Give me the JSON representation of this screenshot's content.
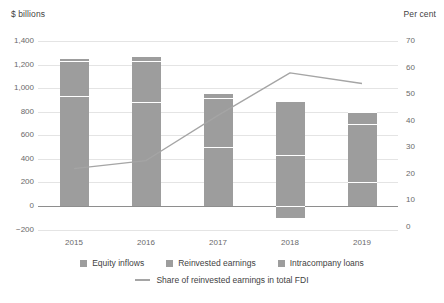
{
  "chart_data": {
    "type": "bar",
    "title": "",
    "subtitle": "",
    "left_axis_title": "$ billions",
    "right_axis_title": "Per cent",
    "xlabel": "",
    "ylabel": "$ billions",
    "categories": [
      "2015",
      "2016",
      "2017",
      "2018",
      "2019"
    ],
    "ylim": [
      -200,
      1400
    ],
    "y2lim": [
      0,
      70
    ],
    "yticks": [
      "-200",
      "0",
      "200",
      "400",
      "600",
      "800",
      "1,000",
      "1,200",
      "1,400"
    ],
    "ytick_values": [
      -200,
      0,
      200,
      400,
      600,
      800,
      1000,
      1200,
      1400
    ],
    "y2ticks": [
      "0",
      "10",
      "20",
      "30",
      "40",
      "50",
      "60",
      "70"
    ],
    "y2tick_values": [
      0,
      10,
      20,
      30,
      40,
      50,
      60,
      70
    ],
    "grid": true,
    "stacked": true,
    "legend_position": "bottom",
    "series": [
      {
        "name": "Equity inflows",
        "type": "bar",
        "axis": "left",
        "values": [
          930,
          880,
          500,
          430,
          205
        ]
      },
      {
        "name": "Reinvested earnings",
        "type": "bar",
        "axis": "left",
        "values": [
          300,
          350,
          420,
          460,
          490
        ]
      },
      {
        "name": "Intracompany loans",
        "type": "bar",
        "axis": "left",
        "values": [
          25,
          40,
          40,
          -100,
          105
        ]
      },
      {
        "name": "Share of reinvested earnings in total FDI",
        "type": "line",
        "axis": "right",
        "values": [
          22,
          25,
          42,
          58,
          54
        ]
      }
    ],
    "totals": [
      1255,
      1270,
      960,
      890,
      800
    ],
    "colors": {
      "bar": "#9d9d9d",
      "line": "#a5a5a5",
      "grid": "#e4e4e4",
      "zero_axis": "#8e8e8e",
      "text": "#3f3f3f",
      "tick_text": "#6a6a6a"
    }
  },
  "legend": {
    "bar_items": [
      {
        "label": "Equity inflows"
      },
      {
        "label": "Reinvested earnings"
      },
      {
        "label": "Intracompany loans"
      }
    ],
    "line_items": [
      {
        "label": "Share of reinvested earnings in total FDI"
      }
    ]
  }
}
